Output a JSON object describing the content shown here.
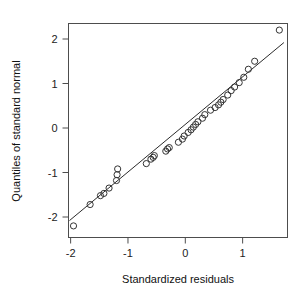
{
  "chart_data": {
    "type": "scatter",
    "title": "",
    "xlabel": "Standardized residuals",
    "ylabel": "Quantiles of standard normal",
    "xlim": [
      -2.15,
      1.8
    ],
    "ylim": [
      -2.45,
      2.42
    ],
    "xticks": [
      -2,
      -1,
      0,
      1
    ],
    "xticklabels": [
      "-2",
      "-1",
      "0",
      "1"
    ],
    "yticks": [
      -2,
      -1,
      0,
      1,
      2
    ],
    "yticklabels": [
      "-2",
      "-1",
      "0",
      "1",
      "2"
    ],
    "grid": false,
    "legend": null,
    "marker": "open-circle",
    "n_points": 38,
    "x": [
      -1.95,
      -1.66,
      -1.48,
      -1.42,
      -1.33,
      -1.2,
      -1.19,
      -1.18,
      -0.68,
      -0.6,
      -0.56,
      -0.54,
      -0.34,
      -0.31,
      -0.28,
      -0.12,
      -0.05,
      -0.02,
      0.05,
      0.1,
      0.14,
      0.18,
      0.22,
      0.3,
      0.34,
      0.44,
      0.52,
      0.58,
      0.62,
      0.66,
      0.74,
      0.8,
      0.86,
      0.94,
      1.02,
      1.1,
      1.21,
      1.64
    ],
    "y": [
      -2.2,
      -1.72,
      -1.52,
      -1.47,
      -1.35,
      -1.18,
      -1.05,
      -0.92,
      -0.8,
      -0.7,
      -0.66,
      -0.62,
      -0.52,
      -0.47,
      -0.44,
      -0.32,
      -0.25,
      -0.18,
      -0.1,
      -0.04,
      0.02,
      0.08,
      0.14,
      0.22,
      0.3,
      0.4,
      0.46,
      0.52,
      0.58,
      0.64,
      0.74,
      0.84,
      0.92,
      1.02,
      1.14,
      1.32,
      1.5,
      2.2
    ],
    "reference_line": {
      "description": "qq reference line",
      "x1": -2.02,
      "y1": -2.08,
      "x2": 1.72,
      "y2": 1.92
    }
  },
  "axes": {
    "x_title": "Standardized residuals",
    "y_title": "Quantiles of standard normal"
  }
}
